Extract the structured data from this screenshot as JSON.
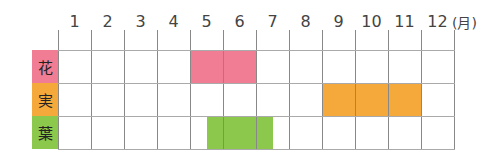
{
  "chart_data": {
    "type": "table",
    "title": "",
    "x_unit": "(月)",
    "months": [
      "1",
      "2",
      "3",
      "4",
      "5",
      "6",
      "7",
      "8",
      "9",
      "10",
      "11",
      "12"
    ],
    "rows": [
      {
        "label": "花",
        "color": "#f07d94",
        "start_month": 5.0,
        "end_month": 7.0,
        "description": "months 5-6"
      },
      {
        "label": "実",
        "color": "#f5a93a",
        "start_month": 9.0,
        "end_month": 12.0,
        "description": "months 9-11"
      },
      {
        "label": "葉",
        "color": "#8cc84b",
        "start_month": 5.5,
        "end_month": 7.5,
        "description": "mid May - mid July"
      }
    ]
  },
  "header": {
    "unit_label": "(月)"
  },
  "rows": [
    {
      "label": "花",
      "color": "#f07d94"
    },
    {
      "label": "実",
      "color": "#f5a93a"
    },
    {
      "label": "葉",
      "color": "#8cc84b"
    }
  ]
}
